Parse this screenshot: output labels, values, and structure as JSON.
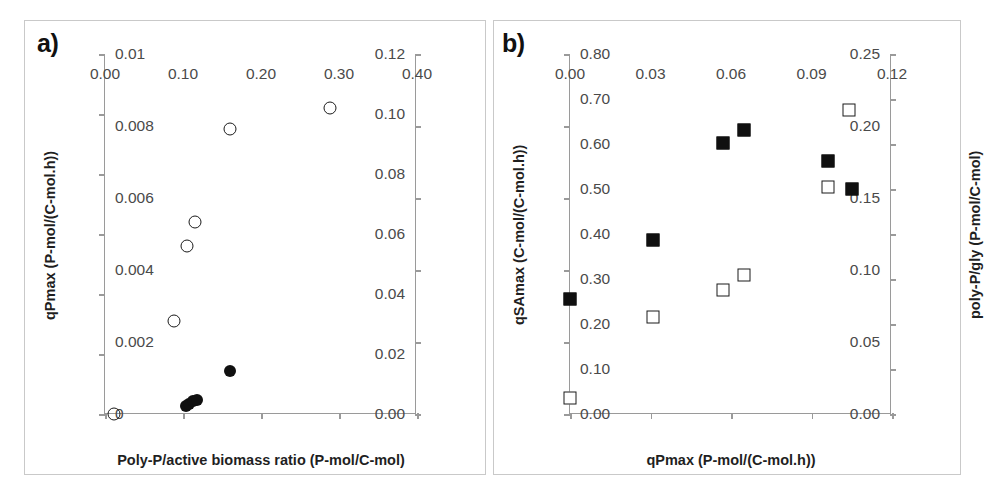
{
  "figure": {
    "panels": [
      {
        "letter": "a)",
        "xlabel": "Poly-P/active biomass ratio (P-mol/C-mol)",
        "ylabel_left": "qPmax (P-mol/(C-mol.h))",
        "ylabel_right": "mATP (mol ATP/(C-mol.h))",
        "xticks": [
          "0.00",
          "0.10",
          "0.20",
          "0.30",
          "0.40"
        ],
        "yticks_left": [
          "0.00",
          "0.02",
          "0.04",
          "0.06",
          "0.08",
          "0.10",
          "0.12"
        ],
        "yticks_right": [
          "0",
          "0.002",
          "0.004",
          "0.006",
          "0.008",
          "0.01"
        ]
      },
      {
        "letter": "b)",
        "xlabel": "qPmax (P-mol/(C-mol.h))",
        "ylabel_left": "qSAmax (C-mol/(C-mol.h))",
        "ylabel_right": "poly-P/gly (P-mol/C-mol)",
        "xticks": [
          "0.00",
          "0.03",
          "0.06",
          "0.09",
          "0.12"
        ],
        "yticks_left": [
          "0.00",
          "0.05",
          "0.10",
          "0.15",
          "0.20",
          "0.25"
        ],
        "yticks_right": [
          "0.00",
          "0.10",
          "0.20",
          "0.30",
          "0.40",
          "0.50",
          "0.60",
          "0.70",
          "0.80"
        ]
      }
    ]
  },
  "chart_data": [
    {
      "type": "scatter",
      "panel": "a)",
      "title": "",
      "xlabel": "Poly-P/active biomass ratio (P-mol/C-mol)",
      "ylabel": "qPmax (P-mol/(C-mol.h))",
      "ylabel_secondary": "mATP (mol ATP/(C-mol.h))",
      "xlim": [
        0.0,
        0.4
      ],
      "ylim": [
        0.0,
        0.12
      ],
      "ylim_secondary": [
        0.0,
        0.01
      ],
      "xticks": [
        0.0,
        0.1,
        0.2,
        0.3,
        0.4
      ],
      "yticks": [
        0.0,
        0.02,
        0.04,
        0.06,
        0.08,
        0.1,
        0.12
      ],
      "yticks_secondary": [
        0.0,
        0.002,
        0.004,
        0.006,
        0.008,
        0.01
      ],
      "grid": false,
      "legend": "none",
      "series": [
        {
          "name": "qPmax",
          "marker": "open-circle",
          "axis": "left",
          "points": [
            {
              "x": 0.012,
              "y": 0.0
            },
            {
              "x": 0.088,
              "y": 0.031
            },
            {
              "x": 0.105,
              "y": 0.056
            },
            {
              "x": 0.115,
              "y": 0.064
            },
            {
              "x": 0.16,
              "y": 0.095
            },
            {
              "x": 0.288,
              "y": 0.102
            }
          ]
        },
        {
          "name": "mATP",
          "marker": "filled-circle",
          "axis": "right",
          "points": [
            {
              "x": 0.104,
              "y": 0.00023
            },
            {
              "x": 0.108,
              "y": 0.00028
            },
            {
              "x": 0.113,
              "y": 0.00037
            },
            {
              "x": 0.118,
              "y": 0.0004
            },
            {
              "x": 0.16,
              "y": 0.0012
            }
          ]
        }
      ]
    },
    {
      "type": "scatter",
      "panel": "b)",
      "title": "",
      "xlabel": "qPmax (P-mol/(C-mol.h))",
      "ylabel": "qSAmax (C-mol/(C-mol.h))",
      "ylabel_secondary": "poly-P/gly (P-mol/C-mol)",
      "xlim": [
        0.0,
        0.12
      ],
      "ylim": [
        0.0,
        0.25
      ],
      "ylim_secondary": [
        0.0,
        0.8
      ],
      "xticks": [
        0.0,
        0.03,
        0.06,
        0.09,
        0.12
      ],
      "yticks": [
        0.0,
        0.05,
        0.1,
        0.15,
        0.2,
        0.25
      ],
      "yticks_secondary": [
        0.0,
        0.1,
        0.2,
        0.3,
        0.4,
        0.5,
        0.6,
        0.7,
        0.8
      ],
      "grid": false,
      "legend": "none",
      "series": [
        {
          "name": "qSAmax",
          "marker": "filled-square",
          "axis": "left",
          "points": [
            {
              "x": 0.0,
              "y": 0.08
            },
            {
              "x": 0.031,
              "y": 0.121
            },
            {
              "x": 0.057,
              "y": 0.188
            },
            {
              "x": 0.065,
              "y": 0.197
            },
            {
              "x": 0.096,
              "y": 0.176
            },
            {
              "x": 0.105,
              "y": 0.156
            }
          ]
        },
        {
          "name": "poly-P/gly",
          "marker": "open-square",
          "axis": "right",
          "points": [
            {
              "x": 0.0,
              "y": 0.035
            },
            {
              "x": 0.031,
              "y": 0.215
            },
            {
              "x": 0.057,
              "y": 0.275
            },
            {
              "x": 0.065,
              "y": 0.31
            },
            {
              "x": 0.096,
              "y": 0.505
            },
            {
              "x": 0.104,
              "y": 0.675
            }
          ]
        }
      ]
    }
  ]
}
